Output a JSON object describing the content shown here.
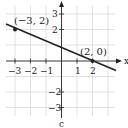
{
  "graph": {
    "x_axis_label": "x",
    "y_axis_label": "y",
    "x_ticks": [
      {
        "value": -3,
        "label": "−3"
      },
      {
        "value": -2,
        "label": "−2"
      },
      {
        "value": -1,
        "label": "−1"
      },
      {
        "value": 1,
        "label": "1"
      },
      {
        "value": 2,
        "label": "2"
      }
    ],
    "y_ticks": [
      {
        "value": 3,
        "label": "3"
      },
      {
        "value": 2,
        "label": "2"
      },
      {
        "value": -2,
        "label": "−2"
      },
      {
        "value": -3,
        "label": "−3"
      }
    ],
    "points": [
      {
        "x": -3,
        "y": 2,
        "label": "(−3, 2)"
      },
      {
        "x": 2,
        "y": 0,
        "label": "(2, 0)"
      }
    ],
    "line": {
      "slope": -0.4,
      "intercept": 0.8,
      "color": "#222222"
    },
    "grid_color": "#cfcfcf",
    "bottom_label": "c"
  }
}
